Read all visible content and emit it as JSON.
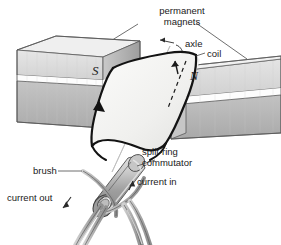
{
  "figure": {
    "background_color": "#ffffff",
    "ink_color": "#1a1a1a",
    "magnet_light": "#dcdcdc",
    "magnet_dark": "#b6b6b6",
    "coil_fill": "#f2f2f0",
    "commutator_fill": "#b9b9b9",
    "wire_fill": "#b3b3b3"
  },
  "labels": {
    "permanent_magnets_line1": "permanent",
    "permanent_magnets_line2": "magnets",
    "axle": "axle",
    "coil": "coil",
    "split_ring_line1": "split-ring",
    "split_ring_line2": "commutator",
    "brush": "brush",
    "current_in": "current in",
    "current_out": "current out",
    "pole_south": "S",
    "pole_north": "N"
  },
  "parts": [
    {
      "name": "permanent-magnet-left",
      "pole": "S"
    },
    {
      "name": "permanent-magnet-right",
      "pole": "N"
    },
    {
      "name": "coil",
      "pole": ""
    },
    {
      "name": "axle",
      "pole": ""
    },
    {
      "name": "split-ring-commutator",
      "pole": ""
    },
    {
      "name": "brush",
      "pole": ""
    },
    {
      "name": "current-in-wire",
      "pole": ""
    },
    {
      "name": "current-out-wire",
      "pole": ""
    }
  ]
}
